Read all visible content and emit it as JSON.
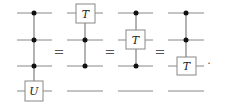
{
  "diagram": {
    "type": "quantum-circuit-identity",
    "wire_count": 4,
    "equals_symbol": "=",
    "terminator": ".",
    "circuits": [
      {
        "name": "circuit-1",
        "controls": [
          0,
          1,
          2
        ],
        "gate": {
          "label": "U",
          "wire": 3
        }
      },
      {
        "name": "circuit-2",
        "controls": [
          1,
          2
        ],
        "gate": {
          "label": "T",
          "wire": 0
        }
      },
      {
        "name": "circuit-3",
        "controls": [
          0,
          2
        ],
        "gate": {
          "label": "T",
          "wire": 1
        }
      },
      {
        "name": "circuit-4",
        "controls": [
          0,
          1
        ],
        "gate": {
          "label": "T",
          "wire": 2
        }
      }
    ]
  }
}
